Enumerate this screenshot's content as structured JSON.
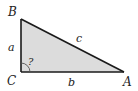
{
  "diagram": {
    "type": "right-triangle",
    "vertices": {
      "B": {
        "label": "B",
        "x": 21,
        "y": 19
      },
      "C": {
        "label": "C",
        "x": 21,
        "y": 72
      },
      "A": {
        "label": "A",
        "x": 124,
        "y": 72
      }
    },
    "sides": {
      "a": {
        "label": "a",
        "from": "B",
        "to": "C"
      },
      "b": {
        "label": "b",
        "from": "C",
        "to": "A"
      },
      "c": {
        "label": "c",
        "from": "A",
        "to": "B"
      }
    },
    "angle_marker": {
      "vertex": "C",
      "label": "?"
    },
    "colors": {
      "fill": "#dcdcdc",
      "stroke": "#1a1a1a",
      "text": "#222222"
    }
  }
}
